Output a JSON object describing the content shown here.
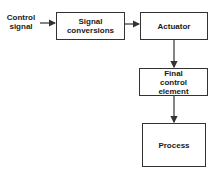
{
  "diagram": {
    "input_label": "Control signal",
    "nodes": [
      {
        "id": "signal-conversions",
        "label": "Signal conversions"
      },
      {
        "id": "actuator",
        "label": "Actuator"
      },
      {
        "id": "final-control-element",
        "label": "Final control element"
      },
      {
        "id": "process",
        "label": "Process"
      }
    ],
    "edges": [
      {
        "from": "Control signal",
        "to": "signal-conversions"
      },
      {
        "from": "signal-conversions",
        "to": "actuator"
      },
      {
        "from": "actuator",
        "to": "final-control-element"
      },
      {
        "from": "final-control-element",
        "to": "process"
      }
    ]
  }
}
